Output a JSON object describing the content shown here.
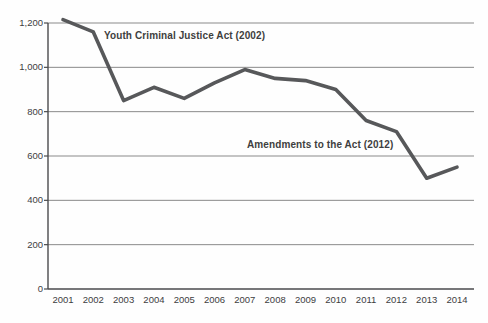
{
  "chart_data": {
    "type": "line",
    "title": "",
    "xlabel": "",
    "ylabel": "",
    "categories": [
      "2001",
      "2002",
      "2003",
      "2004",
      "2005",
      "2006",
      "2007",
      "2008",
      "2009",
      "2010",
      "2011",
      "2012",
      "2013",
      "2014"
    ],
    "values": [
      1215,
      1160,
      850,
      910,
      860,
      930,
      990,
      950,
      940,
      900,
      760,
      710,
      500,
      550
    ],
    "ylim": [
      0,
      1200
    ],
    "ytick_interval": 200,
    "yticks": [
      "0",
      "200",
      "400",
      "600",
      "800",
      "1,000",
      "1,200"
    ],
    "grid": "horizontal gridlines on",
    "legend": "none",
    "annotations": [
      {
        "text": "Youth Criminal Justice Act (2002)"
      },
      {
        "text": "Amendments to the Act (2012)"
      }
    ],
    "colors": {
      "line": "#57585a",
      "grid": "#8a8a8a",
      "axis": "#4a4a4c",
      "text": "#3d3d3f",
      "background": "#fefefe"
    }
  }
}
